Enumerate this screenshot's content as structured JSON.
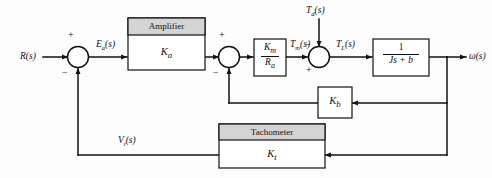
{
  "diagram": {
    "type": "control-block-diagram",
    "colors": {
      "line": "#111111",
      "box_fill": "#ffffff",
      "box_header_fill": "#d4d4d4",
      "box_stroke": "#111111",
      "background": "#fdfdfd",
      "text": "#111111"
    },
    "input_label": "R(s)",
    "output_label": "ω(s)",
    "signals": {
      "error": "E",
      "error_sub": "a",
      "error_suffix": "(s)",
      "motor_torque": "T",
      "motor_torque_sub": "m",
      "motor_torque_suffix": "(s)",
      "disturbance": "T",
      "disturbance_sub": "d",
      "disturbance_suffix": "(s)",
      "load_torque": "T",
      "load_torque_sub": "L",
      "load_torque_suffix": "(s)",
      "tach_voltage": "V",
      "tach_voltage_sub": "t",
      "tach_voltage_suffix": "(s)"
    },
    "blocks": {
      "amplifier": {
        "header": "Amplifier",
        "gain": "K",
        "gain_sub": "a"
      },
      "motor": {
        "numerator": "K",
        "numerator_sub": "m",
        "denominator": "R",
        "denominator_sub": "a"
      },
      "plant": {
        "numerator": "1",
        "denominator": "Js + b"
      },
      "back_emf": {
        "gain": "K",
        "gain_sub": "b"
      },
      "tachometer": {
        "header": "Tachometer",
        "gain": "K",
        "gain_sub": "t"
      }
    },
    "summers": {
      "first": {
        "plus": "+",
        "minus": "−"
      },
      "second": {
        "plus": "+",
        "minus": "−"
      },
      "third": {
        "plus": "+",
        "minus": "−"
      }
    }
  }
}
